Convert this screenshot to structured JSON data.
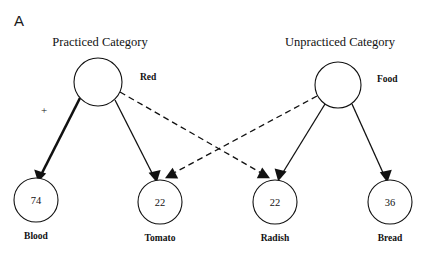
{
  "figure": {
    "panel_letter": "A",
    "width": 433,
    "height": 261
  },
  "columns": [
    {
      "id": "practiced",
      "title": "Practiced Category"
    },
    {
      "id": "unpracticed",
      "title": "Unpracticed Category"
    }
  ],
  "category_nodes": [
    {
      "id": "red",
      "label": "Red",
      "cx": 98,
      "cy": 82,
      "r": 24
    },
    {
      "id": "food",
      "label": "Food",
      "cx": 338,
      "cy": 85,
      "r": 23
    }
  ],
  "exemplar_nodes": [
    {
      "id": "blood",
      "label": "Blood",
      "value": "74",
      "cx": 36,
      "cy": 200,
      "r": 22
    },
    {
      "id": "tomato",
      "label": "Tomato",
      "value": "22",
      "cx": 160,
      "cy": 202,
      "r": 22
    },
    {
      "id": "radish",
      "label": "Radish",
      "value": "22",
      "cx": 275,
      "cy": 202,
      "r": 22
    },
    {
      "id": "bread",
      "label": "Bread",
      "value": "36",
      "cx": 390,
      "cy": 202,
      "r": 22
    }
  ],
  "edges": [
    {
      "id": "red-to-blood",
      "from": "red",
      "to": "blood",
      "style": "solid-thick",
      "annotation": "+"
    },
    {
      "id": "red-to-tomato",
      "from": "red",
      "to": "tomato",
      "style": "solid",
      "annotation": ""
    },
    {
      "id": "red-to-radish",
      "from": "red",
      "to": "radish",
      "style": "dashed",
      "annotation": ""
    },
    {
      "id": "food-to-tomato",
      "from": "food",
      "to": "tomato",
      "style": "dashed",
      "annotation": ""
    },
    {
      "id": "food-to-radish",
      "from": "food",
      "to": "radish",
      "style": "solid",
      "annotation": ""
    },
    {
      "id": "food-to-bread",
      "from": "food",
      "to": "bread",
      "style": "solid",
      "annotation": ""
    }
  ],
  "annotations": [
    {
      "id": "strengthening-plus",
      "text": "+",
      "x": 44,
      "y": 114
    }
  ],
  "colors": {
    "ink": "#111111",
    "background": "#ffffff"
  }
}
